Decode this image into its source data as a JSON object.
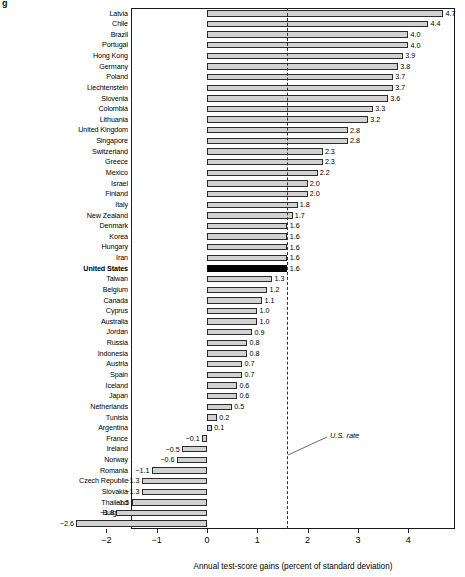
{
  "chart_data": {
    "type": "bar",
    "orientation": "horizontal",
    "title": "",
    "xlabel": "Annual test-score gains (percent of standard deviation)",
    "ylabel": "",
    "xlim": [
      -2.8,
      4.9
    ],
    "xticks": [
      -2,
      -1,
      0,
      1,
      2,
      3,
      4
    ],
    "xticklabels": [
      "−2",
      "−1",
      "0",
      "1",
      "2",
      "3",
      "4"
    ],
    "grid": false,
    "legend": null,
    "reference_line": {
      "value": 1.6,
      "label": "U.S. rate",
      "style": "dashed"
    },
    "highlight_category": "United States",
    "highlight_color": "#000000",
    "bar_color": "#d2d2d2",
    "bar_edge_color": "#2b2b2b",
    "categories": [
      "Latvia",
      "Chile",
      "Brazil",
      "Portugal",
      "Hong Kong",
      "Germany",
      "Poland",
      "Liechtenstein",
      "Slovenia",
      "Colombia",
      "Lithuania",
      "United Kingdom",
      "Singapore",
      "Switzerland",
      "Greece",
      "Mexico",
      "Israel",
      "Finland",
      "Italy",
      "New Zealand",
      "Denmark",
      "Korea",
      "Hungary",
      "Iran",
      "United States",
      "Taiwan",
      "Belgium",
      "Canada",
      "Cyprus",
      "Australia",
      "Jordan",
      "Russia",
      "Indonesia",
      "Austria",
      "Spain",
      "Iceland",
      "Japan",
      "Netherlands",
      "Tunisia",
      "Argentina",
      "France",
      "Ireland",
      "Norway",
      "Romania",
      "Czech Republic",
      "Slovakia",
      "Thailand",
      "Bulgaria",
      "Sweden"
    ],
    "values": [
      4.7,
      4.4,
      4.0,
      4.0,
      3.9,
      3.8,
      3.7,
      3.7,
      3.6,
      3.3,
      3.2,
      2.8,
      2.8,
      2.3,
      2.3,
      2.2,
      2.0,
      2.0,
      1.8,
      1.7,
      1.6,
      1.6,
      1.6,
      1.6,
      1.6,
      1.3,
      1.2,
      1.1,
      1.0,
      1.0,
      0.9,
      0.8,
      0.8,
      0.7,
      0.7,
      0.6,
      0.6,
      0.5,
      0.2,
      0.1,
      -0.1,
      -0.5,
      -0.6,
      -1.1,
      -1.3,
      -1.3,
      -1.5,
      -1.8,
      -2.6
    ],
    "value_labels": [
      "4.7",
      "4.4",
      "4.0",
      "4.0",
      "3.9",
      "3.8",
      "3.7",
      "3.7",
      "3.6",
      "3.3",
      "3.2",
      "2.8",
      "2.8",
      "2.3",
      "2.3",
      "2.2",
      "2.0",
      "2.0",
      "1.8",
      "1.7",
      "1.6",
      "1.6",
      "1.6",
      "1.6",
      "1.6",
      "1.3",
      "1.2",
      "1.1",
      "1.0",
      "1.0",
      "0.9",
      "0.8",
      "0.8",
      "0.7",
      "0.7",
      "0.6",
      "0.6",
      "0.5",
      "0.2",
      "0.1",
      "−0.1",
      "−0.5",
      "−0.6",
      "−1.1",
      "−1.3",
      "−1.3",
      "−1.5",
      "−1.8",
      "−2.6"
    ]
  },
  "figure": {
    "corner_mark": "g"
  }
}
